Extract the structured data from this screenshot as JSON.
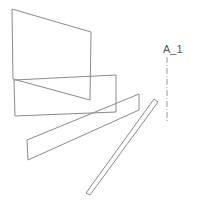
{
  "diagram": {
    "label": "A_1",
    "colors": {
      "edge": "#8a8a8a",
      "axis": "#9a9a9a",
      "label": "#555555",
      "background": "#ffffff"
    },
    "shapes": [
      {
        "name": "upper-quad",
        "points": "12,9 91,32 90,100 13,79"
      },
      {
        "name": "middle-box",
        "points": "14,80 116,75 116,112 15,116"
      },
      {
        "name": "long-parallelogram",
        "points": "27,140 139,94 139,110 28,160"
      },
      {
        "name": "thin-strip",
        "points": "154,99 158,102 90,195 86,193"
      }
    ],
    "axis_line": {
      "x1": 167,
      "y1": 57,
      "x2": 167,
      "y2": 123
    }
  }
}
